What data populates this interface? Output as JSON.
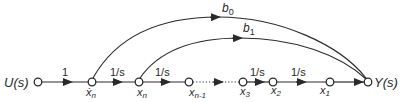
{
  "diagram": {
    "type": "signal-flow-graph",
    "colors": {
      "line": "#2a2a2a",
      "background": "#ffffff"
    },
    "nodes": [
      {
        "id": "U",
        "label": "U(s)",
        "x": 38,
        "y": 82
      },
      {
        "id": "xn_dot",
        "label": "ẋn",
        "main": "ẋ",
        "sub": "n",
        "x": 92,
        "y": 82
      },
      {
        "id": "xn",
        "label": "xn",
        "main": "x",
        "sub": "n",
        "x": 139,
        "y": 82
      },
      {
        "id": "xn1",
        "label": "xn-1",
        "main": "x",
        "sub": "n-1",
        "x": 189,
        "y": 82
      },
      {
        "id": "x3",
        "label": "x3",
        "main": "x",
        "sub": "3",
        "x": 243,
        "y": 82
      },
      {
        "id": "x2",
        "label": "x2",
        "main": "x",
        "sub": "2",
        "x": 273,
        "y": 82
      },
      {
        "id": "x1",
        "label": "x1",
        "main": "x",
        "sub": "1",
        "x": 330,
        "y": 82
      },
      {
        "id": "Y",
        "label": "Y(s)",
        "x": 368,
        "y": 82
      }
    ],
    "branches": [
      {
        "from": "U",
        "to": "xn_dot",
        "gain": "1"
      },
      {
        "from": "xn_dot",
        "to": "xn",
        "gain": "1/s"
      },
      {
        "from": "xn",
        "to": "xn1",
        "gain": "1/s"
      },
      {
        "from": "xn1",
        "to": "x3",
        "gain": "",
        "style": "dotted"
      },
      {
        "from": "x3",
        "to": "x2",
        "gain": "1/s"
      },
      {
        "from": "x2",
        "to": "x1",
        "gain": "1/s"
      },
      {
        "from": "x1",
        "to": "Y",
        "gain": ""
      },
      {
        "from": "xn_dot",
        "to": "Y",
        "gain": "b0",
        "main": "b",
        "sub": "0",
        "style": "arc"
      },
      {
        "from": "xn",
        "to": "Y",
        "gain": "b1",
        "main": "b",
        "sub": "1",
        "style": "arc"
      }
    ],
    "labels": {
      "input": "U(s)",
      "output": "Y(s)",
      "gain_one": "1",
      "gain_integrator": "1/s",
      "b0_main": "b",
      "b0_sub": "0",
      "b1_main": "b",
      "b1_sub": "1",
      "xn_dot_main": "ẋ",
      "xn_dot_sub": "n",
      "xn_main": "x",
      "xn_sub": "n",
      "xn1_main": "x",
      "xn1_sub": "n-1",
      "x3_main": "x",
      "x3_sub": "3",
      "x2_main": "x",
      "x2_sub": "2",
      "x1_main": "x",
      "x1_sub": "1"
    }
  }
}
